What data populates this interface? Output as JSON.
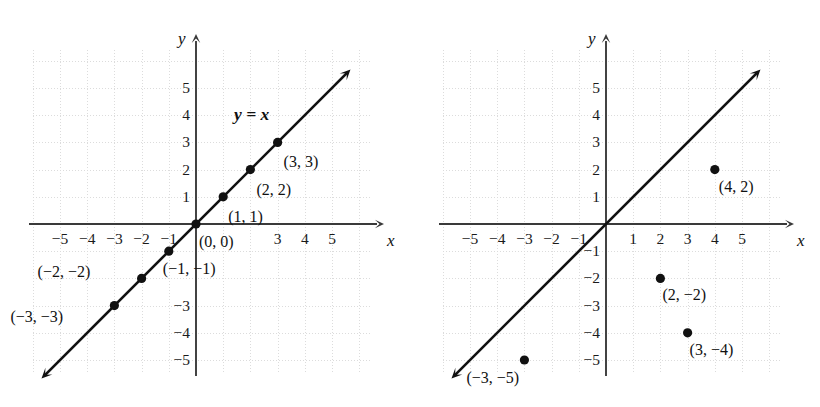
{
  "figure": {
    "axis_color": "#3a3a3a",
    "grid_color": "#dcdcdc",
    "point_color": "#111111",
    "text_color": "#111111"
  },
  "chart_data": [
    {
      "type": "scatter",
      "panel": "left",
      "title": "",
      "xlabel": "x",
      "ylabel": "y",
      "xlim": [
        -6,
        6
      ],
      "ylim": [
        -6,
        6
      ],
      "grid": true,
      "legend": "none",
      "annotations": [
        "y = x"
      ],
      "line": {
        "label": "y = x",
        "equation": "y = x",
        "slope": 1,
        "intercept": 0,
        "from": [
          -5.6,
          -5.6
        ],
        "to": [
          5.6,
          5.6
        ],
        "arrow_both_ends": true
      },
      "points": [
        {
          "x": -3,
          "y": -3,
          "label": "(−3, −3)"
        },
        {
          "x": -2,
          "y": -2,
          "label": "(−2, −2)"
        },
        {
          "x": -1,
          "y": -1,
          "label": "(−1, −1)"
        },
        {
          "x": 0,
          "y": 0,
          "label": "(0, 0)"
        },
        {
          "x": 1,
          "y": 1,
          "label": "(1, 1)"
        },
        {
          "x": 2,
          "y": 2,
          "label": "(2, 2)"
        },
        {
          "x": 3,
          "y": 3,
          "label": "(3, 3)"
        }
      ],
      "xticks_visible": [
        "−5",
        "−4",
        "−3",
        "−2",
        "−1",
        "3",
        "4",
        "5"
      ],
      "yticks_visible": [
        "5",
        "4",
        "3",
        "2",
        "1",
        "−3",
        "−4",
        "−5"
      ]
    },
    {
      "type": "scatter",
      "panel": "right",
      "title": "",
      "xlabel": "x",
      "ylabel": "y",
      "xlim": [
        -6,
        6
      ],
      "ylim": [
        -6,
        6
      ],
      "grid": true,
      "legend": "none",
      "annotations": [],
      "line": {
        "label": "y = x",
        "equation": "y = x",
        "slope": 1,
        "intercept": 0,
        "from": [
          -5.6,
          -5.6
        ],
        "to": [
          5.6,
          5.6
        ],
        "arrow_both_ends": true
      },
      "points": [
        {
          "x": 4,
          "y": 2,
          "label": "(4, 2)"
        },
        {
          "x": 2,
          "y": -2,
          "label": "(2, −2)"
        },
        {
          "x": 3,
          "y": -4,
          "label": "(3, −4)"
        },
        {
          "x": -3,
          "y": -5,
          "label": "(−3, −5)"
        }
      ],
      "xticks_visible": [
        "−5",
        "−4",
        "−3",
        "−2",
        "−1",
        "1",
        "2",
        "3",
        "4",
        "5"
      ],
      "yticks_visible": [
        "5",
        "4",
        "3",
        "2",
        "1",
        "−1",
        "−2",
        "−3",
        "−4",
        "−5"
      ]
    }
  ],
  "left": {
    "axis_x_name": "x",
    "axis_y_name": "y",
    "equation_label": "y = x",
    "xticks": [
      {
        "t": "−5",
        "v": -5
      },
      {
        "t": "−4",
        "v": -4
      },
      {
        "t": "−3",
        "v": -3
      },
      {
        "t": "−2",
        "v": -2
      },
      {
        "t": "−1",
        "v": -1
      },
      {
        "t": "3",
        "v": 3
      },
      {
        "t": "4",
        "v": 4
      },
      {
        "t": "5",
        "v": 5
      }
    ],
    "yticks": [
      {
        "t": "5",
        "v": 5
      },
      {
        "t": "4",
        "v": 4
      },
      {
        "t": "3",
        "v": 3
      },
      {
        "t": "2",
        "v": 2
      },
      {
        "t": "1",
        "v": 1
      },
      {
        "t": "−3",
        "v": -3
      },
      {
        "t": "−4",
        "v": -4
      },
      {
        "t": "−5",
        "v": -5
      }
    ],
    "points": [
      {
        "x": -3,
        "y": -3,
        "label": "(−3, −3)",
        "dx": -104,
        "dy": 3
      },
      {
        "x": -2,
        "y": -2,
        "label": "(−2, −2)",
        "dx": -104,
        "dy": -14
      },
      {
        "x": -1,
        "y": -1,
        "label": "(−1, −1)",
        "dx": -6,
        "dy": 10
      },
      {
        "x": 0,
        "y": 0,
        "label": "(0, 0)",
        "dx": 3,
        "dy": 10
      },
      {
        "x": 1,
        "y": 1,
        "label": "(1, 1)",
        "dx": 5,
        "dy": 12
      },
      {
        "x": 2,
        "y": 2,
        "label": "(2, 2)",
        "dx": 6,
        "dy": 12
      },
      {
        "x": 3,
        "y": 3,
        "label": "(3, 3)",
        "dx": 6,
        "dy": 12
      }
    ]
  },
  "right": {
    "axis_x_name": "x",
    "axis_y_name": "y",
    "equation_label": "",
    "xticks": [
      {
        "t": "−5",
        "v": -5
      },
      {
        "t": "−4",
        "v": -4
      },
      {
        "t": "−3",
        "v": -3
      },
      {
        "t": "−2",
        "v": -2
      },
      {
        "t": "−1",
        "v": -1
      },
      {
        "t": "1",
        "v": 1
      },
      {
        "t": "2",
        "v": 2
      },
      {
        "t": "3",
        "v": 3
      },
      {
        "t": "4",
        "v": 4
      },
      {
        "t": "5",
        "v": 5
      }
    ],
    "yticks": [
      {
        "t": "5",
        "v": 5
      },
      {
        "t": "4",
        "v": 4
      },
      {
        "t": "3",
        "v": 3
      },
      {
        "t": "2",
        "v": 2
      },
      {
        "t": "1",
        "v": 1
      },
      {
        "t": "−1",
        "v": -1
      },
      {
        "t": "−2",
        "v": -2
      },
      {
        "t": "−3",
        "v": -3
      },
      {
        "t": "−4",
        "v": -4
      },
      {
        "t": "−5",
        "v": -5
      }
    ],
    "points": [
      {
        "x": 4,
        "y": 2,
        "label": "(4, 2)",
        "dx": 4,
        "dy": 9
      },
      {
        "x": 2,
        "y": -2,
        "label": "(2, −2)",
        "dx": 2,
        "dy": 9
      },
      {
        "x": 3,
        "y": -4,
        "label": "(3, −4)",
        "dx": 2,
        "dy": 9
      },
      {
        "x": -3,
        "y": -5,
        "label": "(−3, −5)",
        "dx": -58,
        "dy": 10
      }
    ]
  }
}
